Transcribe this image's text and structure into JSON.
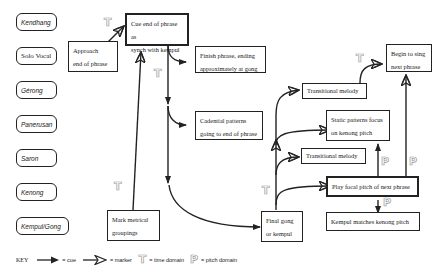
{
  "instruments": [
    {
      "id": "kendhang",
      "label": "Kendhang",
      "style": "italic"
    },
    {
      "id": "solo-vocal",
      "label": "Solo Vocal",
      "style": "plain"
    },
    {
      "id": "gerong",
      "label": "Gérong",
      "style": "italic"
    },
    {
      "id": "panerusan",
      "label": "Panerusan",
      "style": "italic"
    },
    {
      "id": "saron",
      "label": "Saron",
      "style": "italic"
    },
    {
      "id": "kenong",
      "label": "Kenong",
      "style": "italic"
    },
    {
      "id": "kempul-gong",
      "label": "Kempul/Gong",
      "style": "italic"
    }
  ],
  "boxes": {
    "approach": {
      "line1": "Approach",
      "line2": "end of phrase"
    },
    "cue": {
      "line1": "Cue end of phrase as",
      "line2": "synch with kempul"
    },
    "finish": {
      "line1": "Finish phrase, ending",
      "line2": "approximately at gong"
    },
    "cadential": {
      "line1": "Cadential patterns",
      "line2": "going to end of phrase"
    },
    "transitional_top": {
      "line1": "Transitional melody"
    },
    "begin": {
      "line1": "Begin to sing",
      "line2": "next phrase"
    },
    "static": {
      "line1": "Static patterns focus",
      "line2": "on kenong pitch"
    },
    "transitional_mid": {
      "line1": "Transitional melody"
    },
    "play_focal": {
      "line1": "Play focal pitch of next phrase"
    },
    "kempul_matches": {
      "line1": "Kempul matches kenong pitch"
    },
    "final_gong": {
      "line1": "Final gong",
      "line2": "or kempul"
    },
    "mark_metrical": {
      "line1": "Mark metrical",
      "line2": "groupings"
    }
  },
  "markers": {
    "time": "T",
    "pitch": "P"
  },
  "key": {
    "title": "KEY",
    "cue_label": "= cue",
    "marker_label": "= marker",
    "time_label": "= time domain",
    "pitch_label": "= pitch domain"
  },
  "colors": {
    "line": "#222222",
    "marker_outline": "#999999",
    "background": "#ffffff"
  }
}
